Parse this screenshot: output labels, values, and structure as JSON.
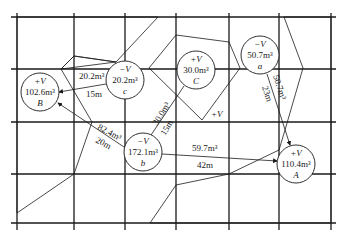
{
  "diagram": {
    "type": "earthwork-balance-grid",
    "grid": {
      "columns_x": [
        17,
        74,
        125,
        176,
        229,
        279,
        331
      ],
      "rows_y": [
        17,
        69,
        122,
        174,
        223
      ]
    },
    "nodes": [
      {
        "id": "B",
        "sign": "+V",
        "volume": "102.6m³",
        "x": 40,
        "y": 92,
        "kind": "fill"
      },
      {
        "id": "c",
        "sign": "−V",
        "volume": "20.2m³",
        "x": 125,
        "y": 80,
        "kind": "cut"
      },
      {
        "id": "C",
        "sign": "+V",
        "volume": "30.0m³",
        "x": 196,
        "y": 70,
        "kind": "fill"
      },
      {
        "id": "a",
        "sign": "−V",
        "volume": "50.7m³",
        "x": 260,
        "y": 55,
        "kind": "cut"
      },
      {
        "id": "b",
        "sign": "−V",
        "volume": "172.1m³",
        "x": 143,
        "y": 152,
        "kind": "cut"
      },
      {
        "id": "A",
        "sign": "+V",
        "volume": "110.4m³",
        "x": 296,
        "y": 164,
        "kind": "fill"
      }
    ],
    "transfers": [
      {
        "from": "c",
        "to": "B",
        "volume": "20.2m³",
        "distance": "15m"
      },
      {
        "from": "b",
        "to": "B",
        "volume": "82.4m³",
        "distance": "20m"
      },
      {
        "from": "b",
        "to": "C",
        "volume": "30.0m³",
        "distance": "15m"
      },
      {
        "from": "b",
        "to": "A",
        "volume": "59.7m³",
        "distance": "42m"
      },
      {
        "from": "a",
        "to": "A",
        "volume": "50.7m³",
        "distance": "23m"
      }
    ],
    "extra_labels": [
      {
        "text": "+V",
        "x": 211,
        "y": 115
      }
    ]
  }
}
